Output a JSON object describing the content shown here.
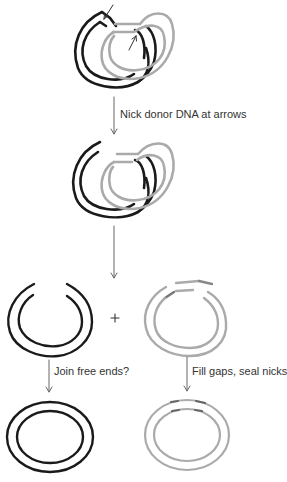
{
  "diagram": {
    "colors": {
      "host_dna": "#1a1a1a",
      "donor_dna": "#aaaaaa",
      "arrow": "#666666",
      "text": "#333333"
    },
    "steps": [
      {
        "label": "Nick donor DNA at arrows"
      },
      {
        "label": ""
      },
      {
        "label": "Join free ends?"
      },
      {
        "label": "Fill gaps, seal nicks"
      }
    ],
    "plus_sign": "+"
  }
}
